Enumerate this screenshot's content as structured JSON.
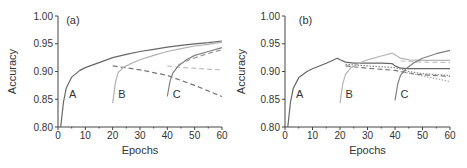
{
  "chart_data": [
    {
      "panel": "(a)",
      "type": "line",
      "title": "",
      "xlabel": "Epochs",
      "ylabel": "Accuracy",
      "xlim": [
        0,
        60
      ],
      "ylim": [
        0.8,
        1.0
      ],
      "xticks": [
        "0",
        "10",
        "20",
        "30",
        "40",
        "50",
        "60"
      ],
      "yticks": [
        "0.80",
        "0.85",
        "0.90",
        "0.95",
        "1.00"
      ],
      "grid": false,
      "annotations": [
        {
          "text": "(a)",
          "x": 3,
          "y": 0.985
        },
        {
          "text": "A",
          "x": 4,
          "y": 0.852
        },
        {
          "text": "B",
          "x": 22,
          "y": 0.852
        },
        {
          "text": "C",
          "x": 42,
          "y": 0.852
        }
      ],
      "series": [
        {
          "name": "A",
          "style": "solid",
          "color": "#666666",
          "x": [
            1,
            2,
            3,
            5,
            8,
            10,
            15,
            20,
            25,
            30,
            35,
            40,
            45,
            50,
            55,
            60
          ],
          "y": [
            0.8,
            0.845,
            0.87,
            0.89,
            0.902,
            0.907,
            0.916,
            0.925,
            0.931,
            0.936,
            0.94,
            0.944,
            0.947,
            0.95,
            0.952,
            0.955
          ]
        },
        {
          "name": "A-drift",
          "style": "dashed",
          "color": "#777777",
          "x": [
            20,
            30,
            40,
            50,
            60
          ],
          "y": [
            0.91,
            0.903,
            0.893,
            0.875,
            0.855
          ]
        },
        {
          "name": "B",
          "style": "solid",
          "color": "#b0b0b0",
          "x": [
            20,
            21,
            22,
            24,
            27,
            30,
            35,
            40,
            45,
            50,
            55,
            60
          ],
          "y": [
            0.843,
            0.88,
            0.898,
            0.908,
            0.915,
            0.921,
            0.929,
            0.936,
            0.941,
            0.946,
            0.949,
            0.953
          ]
        },
        {
          "name": "B-drift",
          "style": "dashed",
          "color": "#c0c0c0",
          "x": [
            40,
            45,
            50,
            55,
            60
          ],
          "y": [
            0.91,
            0.907,
            0.906,
            0.904,
            0.903
          ]
        },
        {
          "name": "C",
          "style": "solid",
          "color": "#808080",
          "x": [
            40,
            41,
            42,
            44,
            47,
            50,
            55,
            60
          ],
          "y": [
            0.855,
            0.883,
            0.897,
            0.91,
            0.921,
            0.929,
            0.936,
            0.943
          ]
        },
        {
          "name": "C-ref",
          "style": "dashed",
          "color": "#999999",
          "x": [
            44,
            48,
            52,
            56,
            60
          ],
          "y": [
            0.912,
            0.921,
            0.928,
            0.934,
            0.939
          ]
        }
      ]
    },
    {
      "panel": "(b)",
      "type": "line",
      "title": "",
      "xlabel": "Epochs",
      "ylabel": "Accuracy",
      "xlim": [
        0,
        60
      ],
      "ylim": [
        0.8,
        1.0
      ],
      "xticks": [
        "0",
        "10",
        "20",
        "30",
        "40",
        "50",
        "60"
      ],
      "yticks": [
        "0.80",
        "0.85",
        "0.90",
        "0.95",
        "1.00"
      ],
      "grid": false,
      "annotations": [
        {
          "text": "(b)",
          "x": 5,
          "y": 0.985
        },
        {
          "text": "A",
          "x": 4,
          "y": 0.852
        },
        {
          "text": "B",
          "x": 22,
          "y": 0.852
        },
        {
          "text": "C",
          "x": 42,
          "y": 0.852
        }
      ],
      "series": [
        {
          "name": "A",
          "style": "solid",
          "color": "#666666",
          "x": [
            1,
            2,
            3,
            5,
            8,
            10,
            15,
            19,
            20,
            22,
            25,
            30,
            35,
            39,
            40,
            42,
            45,
            50,
            55,
            60
          ],
          "y": [
            0.8,
            0.845,
            0.87,
            0.889,
            0.9,
            0.905,
            0.915,
            0.924,
            0.921,
            0.917,
            0.915,
            0.915,
            0.915,
            0.914,
            0.91,
            0.906,
            0.905,
            0.905,
            0.905,
            0.905
          ]
        },
        {
          "name": "A-dotted",
          "style": "dotted",
          "color": "#888888",
          "x": [
            22,
            30,
            40,
            45,
            50,
            60
          ],
          "y": [
            0.913,
            0.91,
            0.907,
            0.9,
            0.896,
            0.893
          ]
        },
        {
          "name": "A-dashed",
          "style": "dashed",
          "color": "#777777",
          "x": [
            22,
            30,
            40,
            45,
            50,
            60
          ],
          "y": [
            0.91,
            0.906,
            0.902,
            0.897,
            0.894,
            0.891
          ]
        },
        {
          "name": "B",
          "style": "solid",
          "color": "#b5b5b5",
          "x": [
            20,
            21,
            22,
            24,
            27,
            30,
            35,
            39,
            40,
            42,
            45,
            50,
            55,
            60
          ],
          "y": [
            0.843,
            0.878,
            0.895,
            0.907,
            0.915,
            0.921,
            0.928,
            0.933,
            0.93,
            0.924,
            0.921,
            0.92,
            0.92,
            0.92
          ]
        },
        {
          "name": "B-dashed",
          "style": "dashed",
          "color": "#c0c0c0",
          "x": [
            42,
            50,
            60
          ],
          "y": [
            0.919,
            0.917,
            0.916
          ]
        },
        {
          "name": "B-dotted",
          "style": "dotted",
          "color": "#aaaaaa",
          "x": [
            42,
            50,
            60
          ],
          "y": [
            0.9,
            0.892,
            0.882
          ]
        },
        {
          "name": "C",
          "style": "solid",
          "color": "#808080",
          "x": [
            40,
            41,
            42,
            44,
            47,
            50,
            55,
            60
          ],
          "y": [
            0.848,
            0.878,
            0.893,
            0.905,
            0.916,
            0.924,
            0.932,
            0.938
          ]
        }
      ]
    }
  ]
}
